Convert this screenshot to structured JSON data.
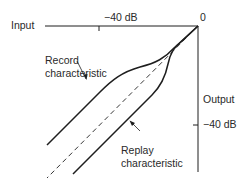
{
  "diagram": {
    "labels": {
      "input_axis": "Input",
      "input_tick": "−40 dB",
      "origin": "0",
      "output_axis": "Output",
      "output_tick": "−40 dB",
      "record_line1": "Record",
      "record_line2": "characteristic",
      "replay_line1": "Replay",
      "replay_line2": "characteristic"
    },
    "colors": {
      "line": "#1e1e1e",
      "text": "#2a2a2a"
    }
  }
}
